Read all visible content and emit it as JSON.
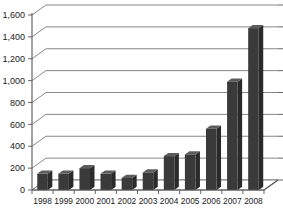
{
  "chart_data": {
    "type": "bar",
    "title": "",
    "subtitle": "",
    "xlabel": "",
    "ylabel": "",
    "categories": [
      "1998",
      "1999",
      "2000",
      "2001",
      "2002",
      "2003",
      "2004",
      "2005",
      "2006",
      "2007",
      "2008"
    ],
    "values": [
      150,
      150,
      200,
      150,
      110,
      160,
      310,
      325,
      560,
      990,
      1480
    ],
    "series": [
      {
        "name": "",
        "values": [
          150,
          150,
          200,
          150,
          110,
          160,
          310,
          325,
          560,
          990,
          1480
        ]
      }
    ],
    "ylim": [
      0,
      1600
    ],
    "ytick_values": [
      0,
      200,
      400,
      600,
      800,
      1000,
      1200,
      1400,
      1600
    ],
    "ytick_labels": [
      "0",
      "200",
      "400",
      "600",
      "800",
      "1,000",
      "1,200",
      "1,400",
      "1,600"
    ],
    "grid": true,
    "legend": false,
    "legend_position": "none",
    "bar_color": "#3a3a3a",
    "background_color": "#ffffff",
    "gridline_color": "#7a7a7a",
    "axis_color": "#555555",
    "style": "3d-perspective"
  },
  "axes": {
    "y_axis_name": "value-axis",
    "x_axis_name": "year-axis"
  }
}
